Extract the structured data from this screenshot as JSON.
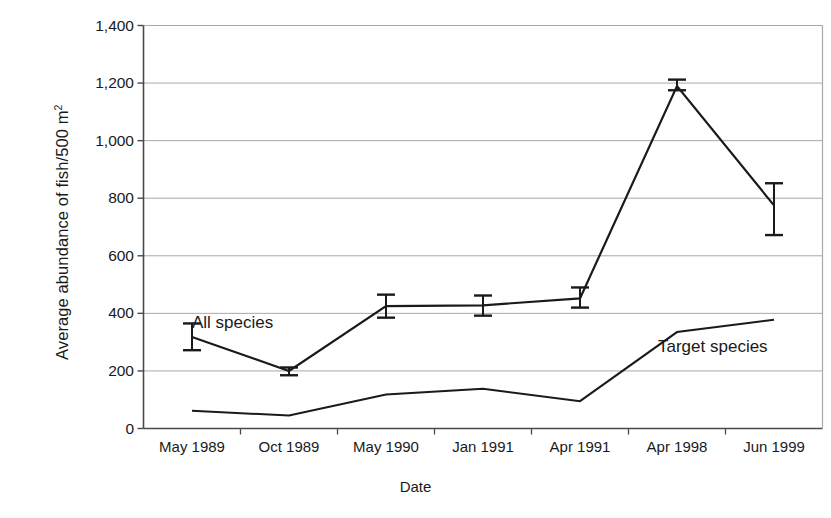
{
  "chart_data": {
    "type": "line",
    "title": "",
    "xlabel": "Date",
    "ylabel": "Average abundance of fish/500 m",
    "ylabel_superscript": "2",
    "categories": [
      "May 1989",
      "Oct 1989",
      "May 1990",
      "Jan 1991",
      "Apr 1991",
      "Apr 1998",
      "Jun 1999"
    ],
    "ylim": [
      0,
      1400
    ],
    "yticks": [
      0,
      200,
      400,
      600,
      800,
      1000,
      1200,
      1400
    ],
    "ytick_labels": [
      "0",
      "200",
      "400",
      "600",
      "800",
      "1,000",
      "1,200",
      "1,400"
    ],
    "grid": true,
    "grid_axis": "y",
    "legend_position": "inline-annotation",
    "series": [
      {
        "name": "All species",
        "values": [
          318,
          200,
          425,
          428,
          452,
          1190,
          775
        ],
        "errors_low": [
          272,
          185,
          385,
          392,
          420,
          1175,
          672
        ],
        "errors_high": [
          365,
          212,
          465,
          462,
          490,
          1212,
          852
        ],
        "has_error_bars": true
      },
      {
        "name": "Target species",
        "values": [
          62,
          45,
          118,
          138,
          95,
          335,
          378
        ],
        "has_error_bars": false
      }
    ],
    "annotations": [
      {
        "text": "All species",
        "series": "All species"
      },
      {
        "text": "Target species",
        "series": "Target species"
      }
    ],
    "colors": {
      "line": "#1a1a1a",
      "grid": "#a8a8a8",
      "axis": "#555555",
      "background": "#ffffff"
    }
  }
}
